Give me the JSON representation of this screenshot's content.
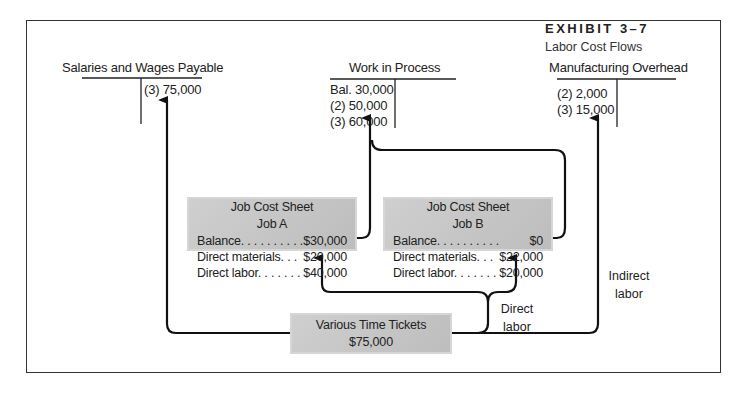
{
  "exhibit": {
    "label": "EXHIBIT 3–7",
    "subtitle": "Labor Cost Flows"
  },
  "accounts": {
    "salaries": {
      "title": "Salaries and Wages Payable",
      "credit_entries": [
        "(3)  75,000"
      ]
    },
    "wip": {
      "title": "Work in Process",
      "debit_entries": [
        "Bal. 30,000",
        "(2)  50,000",
        "(3)  60,000"
      ]
    },
    "moh": {
      "title": "Manufacturing Overhead",
      "debit_entries": [
        "(2)  2,000",
        "(3) 15,000"
      ]
    }
  },
  "job_a": {
    "title": "Job Cost Sheet",
    "job": "Job A",
    "rows": [
      {
        "label": "Balance. . . . . . . . . .",
        "value": "$30,000"
      },
      {
        "label": "Direct materials. . .",
        "value": "$20,000"
      },
      {
        "label": "Direct labor. . . . . . .",
        "value": "$40,000"
      }
    ]
  },
  "job_b": {
    "title": "Job Cost Sheet",
    "job": "Job B",
    "rows": [
      {
        "label": "Balance. . . . . . . . . .",
        "value": "$0"
      },
      {
        "label": "Direct materials. . .",
        "value": "$22,000"
      },
      {
        "label": "Direct labor. . . . . . .",
        "value": "$20,000"
      }
    ]
  },
  "time_tickets": {
    "title": "Various Time Tickets",
    "amount": "$75,000"
  },
  "labels": {
    "direct_1": "Direct",
    "direct_2": "labor",
    "indirect_1": "Indirect",
    "indirect_2": "labor"
  },
  "colors": {
    "box_fill": "#c8c8c8",
    "line": "#111111",
    "frame": "#333333"
  }
}
